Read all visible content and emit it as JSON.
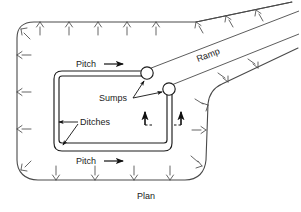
{
  "figure": {
    "caption": "Plan",
    "labels": {
      "pitch_top": "Pitch",
      "pitch_bottom": "Pitch",
      "sumps": "Sumps",
      "ditches": "Ditches",
      "ramp": "Ramp"
    },
    "colors": {
      "line": "#4a4a4a",
      "text": "#222222",
      "arrow": "#111111",
      "background": "#ffffff"
    },
    "annotations": {
      "pitch_arrow_direction": "right",
      "hatch_marks": "inward tick marks along excavation boundary",
      "section_markers": 2,
      "sump_count": 2
    }
  }
}
